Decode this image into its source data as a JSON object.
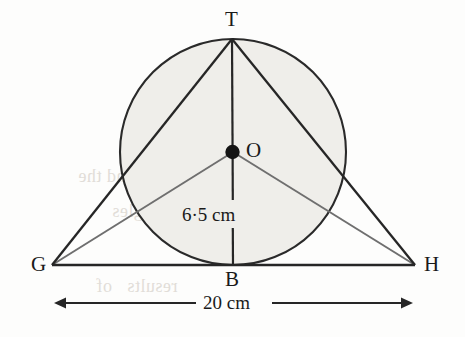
{
  "figure": {
    "type": "geometry-diagram",
    "page_background": "#fdfdfc",
    "circle_fill": "#efeeea",
    "stroke_dark": "#262626",
    "stroke_gray": "#6f6f6f"
  },
  "labels": {
    "apex": "T",
    "centre": "O",
    "base_left": "G",
    "base_right": "H",
    "tangent_point": "B",
    "radius_value": "6·5 cm",
    "base_value": "20 cm"
  },
  "points": {
    "T": {
      "x": 232,
      "y": 39
    },
    "O": {
      "x": 233,
      "y": 152
    },
    "B": {
      "x": 232,
      "y": 265
    },
    "G": {
      "x": 52,
      "y": 265
    },
    "H": {
      "x": 415,
      "y": 265
    }
  },
  "circle": {
    "cx": 233,
    "cy": 152,
    "r": 113
  },
  "segments": [
    {
      "name": "side-TG",
      "from": "T",
      "to": "G",
      "weight": "dark"
    },
    {
      "name": "side-TH",
      "from": "T",
      "to": "H",
      "weight": "dark"
    },
    {
      "name": "base-GH",
      "from": "G",
      "to": "H",
      "weight": "dark"
    },
    {
      "name": "radius-TB",
      "from": "T",
      "to": "B",
      "weight": "dark"
    },
    {
      "name": "radius-OG",
      "from": "O",
      "to": "G",
      "weight": "gray"
    },
    {
      "name": "radius-OH",
      "from": "O",
      "to": "H",
      "weight": "gray"
    }
  ],
  "dimension": {
    "label": "20 cm",
    "y": 303,
    "x_start": 52,
    "x_end": 415
  },
  "bleed_through": [
    {
      "text": "to",
      "x": 300,
      "y": 143,
      "size": 16
    },
    {
      "text": "CB = 12 cm and the",
      "x": 78,
      "y": 178,
      "size": 18
    },
    {
      "text": "angles",
      "x": 112,
      "y": 213,
      "size": 18
    },
    {
      "text": "results   of",
      "x": 96,
      "y": 288,
      "size": 18
    }
  ]
}
